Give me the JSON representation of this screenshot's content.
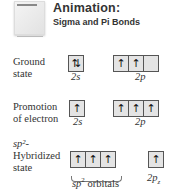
{
  "header": {
    "title": "Animation:",
    "subtitle": "Sigma and Pi Bonds",
    "thumbnail_icon": "animation-thumbnail-icon"
  },
  "rows": [
    {
      "label_line1": "Ground",
      "label_line2": "state",
      "groups": [
        {
          "name": "2s",
          "boxes": [
            "⇅"
          ]
        },
        {
          "name": "2p",
          "boxes": [
            "↑",
            "↑",
            ""
          ]
        }
      ]
    },
    {
      "label_line1": "Promotion",
      "label_line2": "of electron",
      "groups": [
        {
          "name": "2s",
          "boxes": [
            "↑"
          ]
        },
        {
          "name": "2p",
          "boxes": [
            "↑",
            "↑",
            "↑"
          ]
        }
      ]
    },
    {
      "label_line1": "sp²-",
      "label_line2": "Hybridized",
      "label_line3": "state",
      "groups": [
        {
          "name": "sp² orbitals",
          "boxes": [
            "↑",
            "↑",
            "↑"
          ]
        },
        {
          "name": "2pz",
          "boxes": [
            "↑"
          ]
        }
      ]
    }
  ],
  "labels": {
    "r1_2s": "2s",
    "r1_2p": "2p",
    "r2_2s": "2s",
    "r2_2p": "2p",
    "r3_sp2_prefix": "sp",
    "r3_sp2_sup": "2",
    "r3_sp2_suffix": " orbitals",
    "r3_2pz_main": "2p",
    "r3_2pz_sub": "z"
  }
}
